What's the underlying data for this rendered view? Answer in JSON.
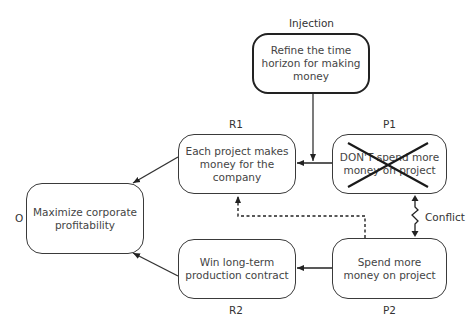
{
  "diagram": {
    "type": "evaporating-cloud",
    "nodes": {
      "injection": {
        "label": "Injection",
        "text": "Refine the time horizon for making money"
      },
      "objective": {
        "label": "O",
        "text": "Maximize corporate profitability"
      },
      "r1": {
        "label": "R1",
        "text": "Each project makes money for the company"
      },
      "r2": {
        "label": "R2",
        "text": "Win long-term production contract"
      },
      "p1": {
        "label": "P1",
        "text": "DON'T spend more money on project",
        "crossed_out": true
      },
      "p2": {
        "label": "P2",
        "text": "Spend more money on project"
      }
    },
    "edges": [
      {
        "from": "r1",
        "to": "objective",
        "style": "solid"
      },
      {
        "from": "r2",
        "to": "objective",
        "style": "solid"
      },
      {
        "from": "p1",
        "to": "r1",
        "style": "solid"
      },
      {
        "from": "p2",
        "to": "r2",
        "style": "solid"
      },
      {
        "from": "injection",
        "to": "r1",
        "style": "solid"
      },
      {
        "from": "p2",
        "to": "r1",
        "style": "dashed"
      },
      {
        "from": "p1",
        "to": "p2",
        "style": "zigzag",
        "label": "Conflict"
      }
    ],
    "conflict_label": "Conflict",
    "colors": {
      "line": "#222222",
      "box_border": "#3a3a3a",
      "text": "#444444"
    }
  }
}
